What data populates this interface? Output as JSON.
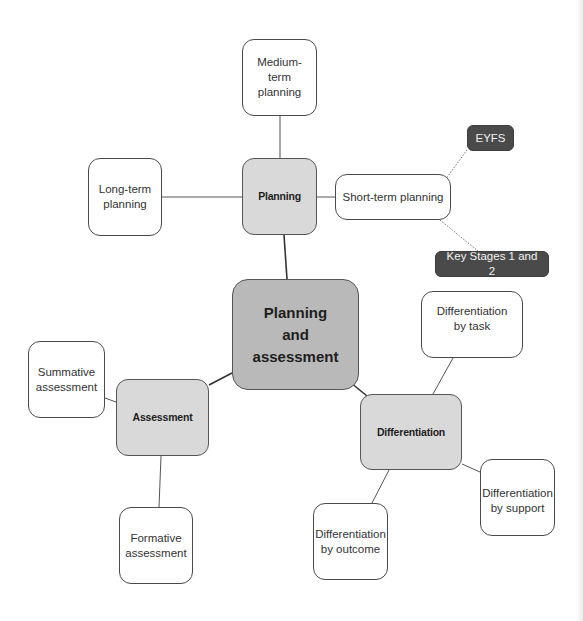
{
  "diagram": {
    "center": {
      "label": "Planning\nand\nassessment"
    },
    "hubs": {
      "planning": {
        "label": "Planning"
      },
      "assessment": {
        "label": "Assessment"
      },
      "differentiation": {
        "label": "Differentiation"
      }
    },
    "planning_children": {
      "medium_term": {
        "label": "Medium-term\nplanning"
      },
      "long_term": {
        "label": "Long-term\nplanning"
      },
      "short_term": {
        "label": "Short-term planning"
      }
    },
    "short_term_children": {
      "eyfs": {
        "label": "EYFS"
      },
      "key_stages": {
        "label": "Key Stages 1 and 2"
      }
    },
    "assessment_children": {
      "summative": {
        "label": "Summative\nassessment"
      },
      "formative": {
        "label": "Formative\nassessment"
      }
    },
    "differentiation_children": {
      "by_task": {
        "label": "Differentiation\nby task"
      },
      "by_support": {
        "label": "Differentiation\nby support"
      },
      "by_outcome": {
        "label": "Differentiation\nby outcome"
      }
    },
    "colors": {
      "center_fill": "#b9b9b9",
      "hub_fill": "#d9d9d9",
      "leaf_fill": "#ffffff",
      "dark_fill": "#4a4a4a",
      "line": "#555555"
    }
  }
}
